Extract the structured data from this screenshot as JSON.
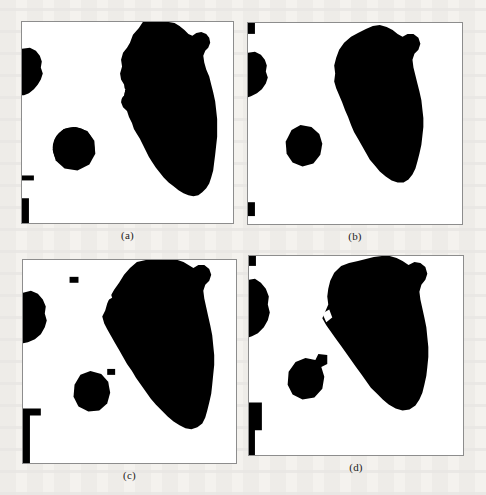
{
  "figure": {
    "type": "binary-segmentation-results",
    "layout": "2x2 grid of binary (black on white) segmentation masks",
    "background_color": "#f4f2ee",
    "panel_background": "#ffffff",
    "panel_border_color": "#8d8d8d",
    "mask_color": "#000000",
    "panels": [
      {
        "id": "a",
        "caption": "(a)",
        "position": "top-left",
        "description": "Binary mask: large elongated region running top-right to bottom-centre, one medium round blob at left edge, one small round blob centre-left, two tiny fragments on the left border",
        "regions": [
          {
            "name": "main-region",
            "area_fraction": 0.3
          },
          {
            "name": "left-edge-blob",
            "area_fraction": 0.022
          },
          {
            "name": "centre-blob",
            "area_fraction": 0.012
          },
          {
            "name": "left-border-fragment-1",
            "area_fraction": 0.001
          },
          {
            "name": "left-border-fragment-2",
            "area_fraction": 0.002
          }
        ]
      },
      {
        "id": "b",
        "caption": "(b)",
        "position": "top-right",
        "description": "Binary mask: large elongated region, smaller left-edge blob, small round blob centre-left, two small square fragments at top-left and bottom-left corners",
        "regions": [
          {
            "name": "main-region",
            "area_fraction": 0.27
          },
          {
            "name": "left-edge-blob",
            "area_fraction": 0.016
          },
          {
            "name": "centre-blob",
            "area_fraction": 0.01
          },
          {
            "name": "corner-fragment-top",
            "area_fraction": 0.0008
          },
          {
            "name": "corner-fragment-bottom",
            "area_fraction": 0.0008
          }
        ]
      },
      {
        "id": "c",
        "caption": "(c)",
        "position": "bottom-left",
        "description": "Binary mask: largest/thickest elongated region reaching the bottom-right, left-edge blob, centre blob, isolated speckle near top-left and a speckle left of the centre blob, an L-shaped fragment on the lower-left border",
        "regions": [
          {
            "name": "main-region",
            "area_fraction": 0.34
          },
          {
            "name": "left-edge-blob",
            "area_fraction": 0.024
          },
          {
            "name": "centre-blob",
            "area_fraction": 0.014
          },
          {
            "name": "speckle-top",
            "area_fraction": 0.0006
          },
          {
            "name": "speckle-centre",
            "area_fraction": 0.0005
          },
          {
            "name": "lower-left-border-fragment",
            "area_fraction": 0.004
          }
        ]
      },
      {
        "id": "d",
        "caption": "(d)",
        "position": "bottom-right",
        "description": "Binary mask: broad elongated region with a wide upper body, left-edge blob attached to the border, centre blob with a small tab on its upper right, vertical fragment on the lower-left border",
        "regions": [
          {
            "name": "main-region",
            "area_fraction": 0.33
          },
          {
            "name": "left-edge-blob",
            "area_fraction": 0.023
          },
          {
            "name": "centre-blob",
            "area_fraction": 0.013
          },
          {
            "name": "lower-left-border-fragment",
            "area_fraction": 0.003
          }
        ]
      }
    ]
  }
}
